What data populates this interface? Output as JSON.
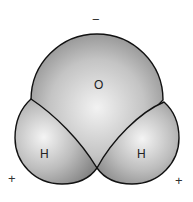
{
  "diagram": {
    "atoms": [
      {
        "symbol": "O",
        "role": "oxygen"
      },
      {
        "symbol": "H",
        "role": "hydrogen-left"
      },
      {
        "symbol": "H",
        "role": "hydrogen-right"
      }
    ],
    "charges": {
      "top": "−",
      "bottom_left": "+",
      "bottom_right": "+"
    },
    "colors": {
      "fill_light": "#f2f2f2",
      "fill_dark": "#8a8a8a",
      "outline": "#111111"
    }
  }
}
